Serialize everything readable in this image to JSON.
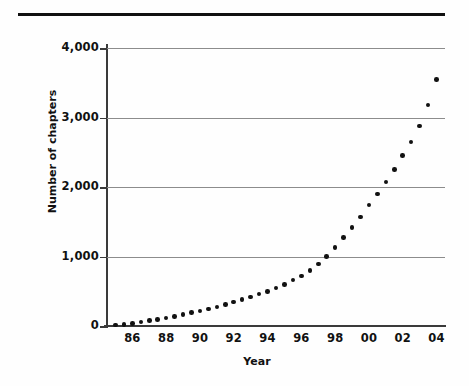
{
  "figure": {
    "background_color": "#fefefe",
    "rule_color": "#111111",
    "axis_color": "#3a3a3a",
    "grid_color": "#8c8c8c",
    "marker_color": "#111111"
  },
  "chart_data": {
    "type": "scatter",
    "title": "",
    "xlabel": "Year",
    "ylabel": "Number of chapters",
    "xlim": [
      1984.5,
      2004.5
    ],
    "ylim": [
      0,
      4000
    ],
    "grid": true,
    "legend": null,
    "ytick_labels": [
      "4,000",
      "3,000",
      "2,000",
      "1,000",
      "0"
    ],
    "ytick_values": [
      4000,
      3000,
      2000,
      1000,
      0
    ],
    "xtick_labels": [
      "86",
      "88",
      "90",
      "92",
      "94",
      "96",
      "98",
      "00",
      "02",
      "04"
    ],
    "xtick_values": [
      1986,
      1988,
      1990,
      1992,
      1994,
      1996,
      1998,
      2000,
      2002,
      2004
    ],
    "x": [
      1985.0,
      1985.5,
      1986.0,
      1986.5,
      1987.0,
      1987.5,
      1988.0,
      1988.5,
      1989.0,
      1989.5,
      1990.0,
      1990.5,
      1991.0,
      1991.5,
      1992.0,
      1992.5,
      1993.0,
      1993.5,
      1994.0,
      1994.5,
      1995.0,
      1995.5,
      1996.0,
      1996.5,
      1997.0,
      1997.5,
      1998.0,
      1998.5,
      1999.0,
      1999.5,
      2000.0,
      2000.5,
      2001.0,
      2001.5,
      2002.0,
      2002.5,
      2003.0,
      2003.5,
      2004.0
    ],
    "values": [
      15,
      25,
      40,
      55,
      75,
      95,
      115,
      140,
      165,
      190,
      215,
      245,
      275,
      310,
      345,
      385,
      420,
      460,
      500,
      545,
      600,
      660,
      720,
      800,
      890,
      1000,
      1130,
      1270,
      1420,
      1570,
      1740,
      1900,
      2070,
      2250,
      2450,
      2650,
      2880,
      3180,
      3545
    ]
  }
}
